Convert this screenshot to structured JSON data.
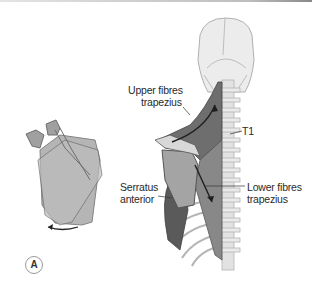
{
  "figure": {
    "panel_label": "A",
    "labels": {
      "upper_fibres_line1": "Upper fibres",
      "upper_fibres_line2": "trapezius",
      "t1": "T1",
      "serratus_line1": "Serratus",
      "serratus_line2": "anterior",
      "lower_fibres_line1": "Lower fibres",
      "lower_fibres_line2": "trapezius"
    },
    "colors": {
      "bone": "#e6e6e6",
      "bone_outline": "#a8a8a8",
      "muscle_dark": "#5e5e5e",
      "muscle_mid": "#8c8c8c",
      "scapula": "#9c9c9c",
      "arrow": "#2a2a2a"
    }
  }
}
